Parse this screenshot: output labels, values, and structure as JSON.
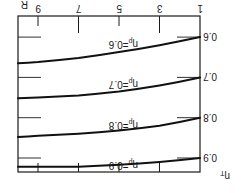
{
  "figure": {
    "rotation_deg": 180,
    "ink_color": "#111111",
    "background": "#ffffff"
  },
  "chart_data": {
    "type": "line",
    "title": "",
    "xlabel": "R",
    "ylabel": "ηT",
    "x_ticks": [
      1,
      3,
      5,
      7,
      9
    ],
    "y_ticks": [
      0.6,
      0.7,
      0.8,
      0.9
    ],
    "y_tick_labels": [
      "0.6",
      "0.7",
      "0.8",
      "0.9"
    ],
    "xlim": [
      1,
      10.1
    ],
    "ylim": [
      0.55,
      0.94
    ],
    "grid": false,
    "legend": "inline annotations",
    "x": [
      1,
      3,
      5,
      7,
      9,
      10.1
    ],
    "series": [
      {
        "name": "ηp=0.6",
        "label_main": "η",
        "label_sub": "p",
        "label_value": "=0.6",
        "values": [
          0.6,
          0.62,
          0.637,
          0.652,
          0.662,
          0.665
        ]
      },
      {
        "name": "ηp=0.7",
        "label_main": "η",
        "label_sub": "p",
        "label_value": "=0.7",
        "values": [
          0.7,
          0.72,
          0.735,
          0.745,
          0.75,
          0.752
        ]
      },
      {
        "name": "ηp=0.8",
        "label_main": "η",
        "label_sub": "p",
        "label_value": "=0.8",
        "values": [
          0.8,
          0.82,
          0.832,
          0.84,
          0.845,
          0.848
        ]
      },
      {
        "name": "ηp=0.9",
        "label_main": "η",
        "label_sub": "p",
        "label_value": "=0.9",
        "values": [
          0.9,
          0.91,
          0.917,
          0.922,
          0.922,
          0.922
        ]
      }
    ],
    "annotations": [
      "ηp=0.6",
      "ηp=0.7",
      "ηp=0.8",
      "ηp=0.9"
    ]
  },
  "axes": {
    "x_label": "R",
    "y_label_main": "η",
    "y_label_sub": "T",
    "x_tick_labels": [
      "1",
      "3",
      "5",
      "7",
      "9"
    ],
    "y_tick_labels": [
      "0.6",
      "0.7",
      "0.8",
      "0.9"
    ]
  }
}
